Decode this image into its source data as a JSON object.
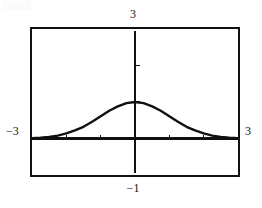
{
  "artifact": {
    "text": ""
  },
  "labels": {
    "top": "3",
    "bottom": "−1",
    "left": "−3",
    "right": "3"
  },
  "chart_data": {
    "type": "line",
    "title": "",
    "xlabel": "",
    "ylabel": "",
    "xlim": [
      -3,
      3
    ],
    "ylim": [
      -1,
      3
    ],
    "grid": false,
    "legend": null,
    "tick_labels": {
      "x": [
        "-3",
        "3"
      ],
      "y": [
        "-1",
        "3"
      ]
    },
    "x_ticks": [
      -2,
      -1,
      1,
      2
    ],
    "y_ticks": [
      1,
      2
    ],
    "axes_drawn": [
      "x-axis at y=0",
      "y-axis at x=0"
    ],
    "series": [
      {
        "name": "bell curve",
        "description": "Gaussian-shaped bell curve peaking at x = 0",
        "x": [
          -3.0,
          -2.75,
          -2.5,
          -2.25,
          -2.0,
          -1.75,
          -1.5,
          -1.25,
          -1.0,
          -0.75,
          -0.5,
          -0.25,
          0.0,
          0.25,
          0.5,
          0.75,
          1.0,
          1.25,
          1.5,
          1.75,
          2.0,
          2.25,
          2.5,
          2.75,
          3.0
        ],
        "y": [
          0.01,
          0.02,
          0.04,
          0.08,
          0.14,
          0.22,
          0.32,
          0.46,
          0.61,
          0.76,
          0.88,
          0.97,
          1.0,
          0.97,
          0.88,
          0.76,
          0.61,
          0.46,
          0.32,
          0.22,
          0.14,
          0.08,
          0.04,
          0.02,
          0.01
        ],
        "peak_x": 0,
        "peak_y": 1.0,
        "color": "#101010"
      }
    ]
  },
  "colors": {
    "ink": "#101010",
    "frame": "#121212",
    "background": "#ffffff"
  }
}
